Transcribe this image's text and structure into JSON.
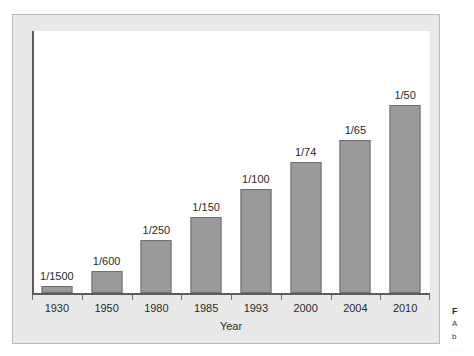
{
  "chart_data": {
    "type": "bar",
    "title": "",
    "xlabel": "Year",
    "ylabel": "",
    "grid": false,
    "legend": "none",
    "categories": [
      "1930",
      "1950",
      "1980",
      "1985",
      "1993",
      "2000",
      "2004",
      "2010"
    ],
    "value_labels": [
      "1/1500",
      "1/600",
      "1/250",
      "1/150",
      "1/100",
      "1/74",
      "1/65",
      "1/50"
    ],
    "values": [
      0.000667,
      0.001667,
      0.004,
      0.006667,
      0.01,
      0.013514,
      0.015385,
      0.02
    ],
    "denominators": [
      1500,
      600,
      250,
      150,
      100,
      74,
      65,
      50
    ],
    "ylim": [
      0,
      0.0225
    ],
    "bar_pixel_heights": [
      7,
      22,
      53,
      76,
      104,
      131,
      153,
      188
    ],
    "annotations": [
      {
        "category": "2010",
        "text": "Projected",
        "placement": "inside-bar",
        "rotation": -90
      }
    ],
    "bar_color": "#9a9a9a",
    "bar_border_color": "#6f6f6f",
    "axis_color": "#5c5c5c",
    "plot_background": "#ffffff",
    "panel_background": "#e9e9e9"
  },
  "axis": {
    "x_title": "Year"
  },
  "caption": {
    "figure_number": "F",
    "line_1": "A",
    "line_2": "b"
  }
}
